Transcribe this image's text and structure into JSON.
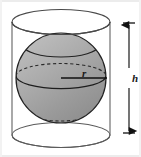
{
  "figure": {
    "background_color": "#ffffff",
    "width": 141,
    "height": 157,
    "labels": {
      "radius": "r",
      "height": "h"
    },
    "colors": {
      "sphere_fill_light": "#b4b4b4",
      "sphere_fill_mid": "#a0a0a0",
      "sphere_fill_dark": "#8c8c8c",
      "outline": "#1f1f1f",
      "cylinder_outline": "#555555",
      "dimension_line": "#111111",
      "frame_edge": "#d8d8d8"
    }
  },
  "geometry": {
    "cylinder": {
      "name": "cylinder",
      "left_wall_x": 12,
      "right_wall_x": 110,
      "top_ellipse_center_y": 22,
      "bottom_ellipse_center_y": 135,
      "ellipse_rx": 49,
      "ellipse_ry": 12.5,
      "fill": "none"
    },
    "sphere": {
      "name": "sphere",
      "center_x": 61,
      "center_y": 78,
      "radius": 45
    },
    "upper_section_arc": {
      "name": "upper-cut-arc",
      "center_y": 46,
      "rx": 37,
      "ry": 11
    },
    "equator": {
      "name": "equator-ellipse",
      "center_y": 76,
      "rx": 45,
      "ry": 12.5,
      "back_half_style": "dashed",
      "front_half_style": "solid"
    },
    "lower_arc": {
      "name": "lower-cut-arc",
      "center_y": 110,
      "rx": 37,
      "ry": 11,
      "style": "dashed"
    },
    "radius_line": {
      "name": "radius-measure",
      "x1": 61,
      "y1": 78,
      "x2": 107,
      "y2": 78
    },
    "height_dimension": {
      "name": "height-measure",
      "x": 129,
      "y_top": 23,
      "y_bottom": 133,
      "tick_half_width": 6,
      "arrowheads": "both"
    }
  }
}
